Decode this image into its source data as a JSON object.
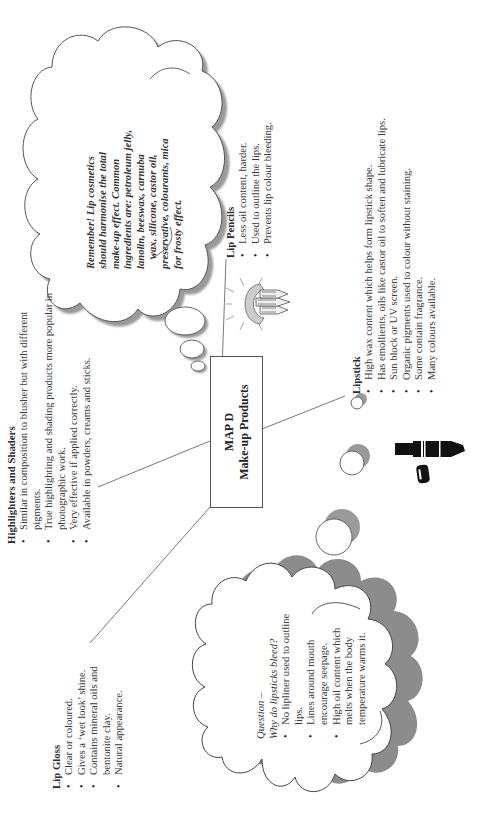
{
  "center": {
    "title": "MAP D",
    "subtitle": "Make-up Products"
  },
  "highlighters": {
    "heading": "Highlighters and Shaders",
    "items": [
      "Similar in composition to blusher but with different pigments.",
      "True highlighting and shading products more popular in photographic work.",
      "Very effective if applied correctly.",
      "Available in powders, creams and sticks."
    ]
  },
  "lip_pencils": {
    "heading": "Lip Pencils",
    "items": [
      "Less oil content, harder.",
      "Used to outline the lips.",
      "Prevents lip colour bleeding."
    ]
  },
  "lipstick": {
    "heading": "Lipstick",
    "items": [
      "High wax content which helps form lipstick shape.",
      "Has emollients, oils like castor oil to soften and lubricate lips.",
      "Sun block or UV screen.",
      "Organic pigments used to colour without staining.",
      "Some contain fragrance.",
      "Many colours available."
    ]
  },
  "lip_gloss": {
    "heading": "Lip Gloss",
    "items": [
      "Clear or coloured.",
      "Gives a ‘wet look’ shine.",
      "Contains mineral oils and bentonite clay.",
      "Natural appearance."
    ]
  },
  "remember_note": {
    "lines": [
      "Remember! Lip cosmetics",
      "should harmonise the total",
      "make-up effect. Common",
      "ingredients are: petroleum jelly,",
      "lanolin, beeswax, carnuba",
      "wax, silicone, castor oil,",
      "preservative, colourants, mica",
      "for frosty effect."
    ]
  },
  "question_note": {
    "title": "Question –",
    "question": "Why do lipsticks bleed?",
    "items": [
      "No lipliner used to outline lips.",
      "Lines around mouth encourage seepage.",
      "High oil content which melts when the body temperature warms it."
    ]
  },
  "icons": {
    "lip_pencils": "lip-pencils-icon",
    "lipstick": "lipstick-icon"
  },
  "colors": {
    "line": "#666666",
    "shadow": "#8c8c8c",
    "text": "#333333"
  }
}
